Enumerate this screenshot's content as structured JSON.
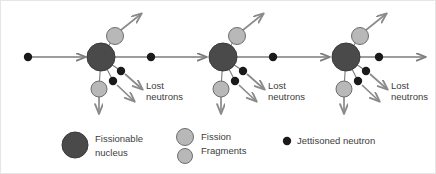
{
  "figure": {
    "background": "#ffffff",
    "border_color": "#e6e6e6",
    "width": 436,
    "height": 174
  },
  "colors": {
    "nucleus_fill": "#4a4a4a",
    "nucleus_stroke": "#3a3a3a",
    "fragment_fill": "#b8b8b8",
    "fragment_stroke": "#6e6e6e",
    "neutron_fill": "#1a1a1a",
    "arrow_gray": "#8a8a8a",
    "axis_line": "#7d7d7d",
    "text": "#3c3c3c"
  },
  "annotations": {
    "lost_neutrons_line1": "Lost",
    "lost_neutrons_line2": "neutrons"
  },
  "clusters": [
    {
      "id": "cluster-1",
      "nucleus": {
        "cx": 100,
        "cy": 56,
        "r": 14
      },
      "incoming_arrow": {
        "x1": 30,
        "y1": 56,
        "x2": 84,
        "y2": 56
      },
      "incoming_neutron": {
        "cx": 27,
        "cy": 56,
        "r": 4.2
      },
      "fragment_up": {
        "cx": 114,
        "cy": 35,
        "r": 8.5,
        "arrow": {
          "x1": 120,
          "y1": 29,
          "x2": 140,
          "y2": 13
        }
      },
      "fragment_down": {
        "cx": 98,
        "cy": 88,
        "r": 8.0,
        "arrow": {
          "x1": 98,
          "y1": 96,
          "x2": 98,
          "y2": 112
        }
      },
      "jettisoned_neutrons": [
        {
          "cx": 120,
          "cy": 70,
          "r": 4.2,
          "arrow": {
            "x1": 124,
            "y1": 73,
            "x2": 141,
            "y2": 88
          }
        },
        {
          "cx": 112,
          "cy": 80,
          "r": 4.2,
          "arrow": {
            "x1": 116,
            "y1": 84,
            "x2": 133,
            "y2": 100
          }
        }
      ],
      "outgoing_axis": {
        "x1": 114,
        "y1": 56,
        "x2": 205,
        "y2": 56
      },
      "axis_neutron": {
        "cx": 150,
        "cy": 56,
        "r": 4.2
      },
      "lost_label": {
        "x": 145,
        "y": 88
      }
    },
    {
      "id": "cluster-2",
      "nucleus": {
        "cx": 222,
        "cy": 56,
        "r": 14
      },
      "incoming_arrow": null,
      "incoming_neutron": null,
      "fragment_up": {
        "cx": 236,
        "cy": 35,
        "r": 8.5,
        "arrow": {
          "x1": 242,
          "y1": 29,
          "x2": 262,
          "y2": 13
        }
      },
      "fragment_down": {
        "cx": 220,
        "cy": 88,
        "r": 8.0,
        "arrow": {
          "x1": 220,
          "y1": 96,
          "x2": 220,
          "y2": 112
        }
      },
      "jettisoned_neutrons": [
        {
          "cx": 242,
          "cy": 70,
          "r": 4.2,
          "arrow": {
            "x1": 246,
            "y1": 73,
            "x2": 263,
            "y2": 88
          }
        },
        {
          "cx": 234,
          "cy": 80,
          "r": 4.2,
          "arrow": {
            "x1": 238,
            "y1": 84,
            "x2": 255,
            "y2": 100
          }
        }
      ],
      "outgoing_axis": {
        "x1": 236,
        "y1": 56,
        "x2": 328,
        "y2": 56
      },
      "axis_neutron": {
        "cx": 272,
        "cy": 56,
        "r": 4.2
      },
      "lost_label": {
        "x": 267,
        "y": 88
      }
    },
    {
      "id": "cluster-3",
      "nucleus": {
        "cx": 345,
        "cy": 56,
        "r": 14
      },
      "incoming_arrow": null,
      "incoming_neutron": null,
      "fragment_up": {
        "cx": 359,
        "cy": 35,
        "r": 8.5,
        "arrow": {
          "x1": 365,
          "y1": 29,
          "x2": 385,
          "y2": 13
        }
      },
      "fragment_down": {
        "cx": 343,
        "cy": 88,
        "r": 8.0,
        "arrow": {
          "x1": 343,
          "y1": 96,
          "x2": 343,
          "y2": 112
        }
      },
      "jettisoned_neutrons": [
        {
          "cx": 365,
          "cy": 70,
          "r": 4.2,
          "arrow": {
            "x1": 369,
            "y1": 73,
            "x2": 386,
            "y2": 88
          }
        },
        {
          "cx": 357,
          "cy": 80,
          "r": 4.2,
          "arrow": {
            "x1": 361,
            "y1": 84,
            "x2": 378,
            "y2": 100
          }
        }
      ],
      "outgoing_axis": {
        "x1": 359,
        "y1": 56,
        "x2": 424,
        "y2": 56
      },
      "axis_neutron": {
        "cx": 378,
        "cy": 56,
        "r": 4.2
      },
      "lost_label": {
        "x": 390,
        "y": 88
      }
    }
  ],
  "legend": {
    "items": [
      {
        "key": "fissionable-nucleus",
        "swatch": {
          "cx": 74,
          "cy": 144,
          "r": 13,
          "kind": "nucleus"
        },
        "line1": "Fissionable",
        "line2": "nucleus",
        "text_x": 94,
        "text_y": 141
      },
      {
        "key": "fission-fragments",
        "swatch_a": {
          "cx": 184,
          "cy": 136,
          "r": 8.5,
          "kind": "fragment"
        },
        "swatch_b": {
          "cx": 184,
          "cy": 155,
          "r": 7.5,
          "kind": "fragment"
        },
        "line1": "Fission",
        "line2": "Fragments",
        "text_x": 200,
        "text_y": 139
      },
      {
        "key": "jettisoned-neutron",
        "swatch": {
          "cx": 286,
          "cy": 140,
          "r": 4.2,
          "kind": "neutron"
        },
        "line1": "Jettisoned neutron",
        "text_x": 296,
        "text_y": 143
      }
    ]
  }
}
